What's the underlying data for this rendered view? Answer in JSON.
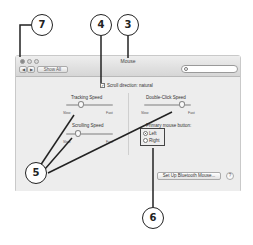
{
  "window": {
    "title": "Mouse",
    "toolbar": {
      "back_label": "◀",
      "forward_label": "▶",
      "show_all_label": "Show All",
      "search_placeholder": ""
    }
  },
  "content": {
    "scroll_direction": {
      "label": "Scroll direction: natural",
      "checked": true,
      "check_glyph": "✓"
    },
    "tracking_speed": {
      "label": "Tracking Speed",
      "min_label": "Slow",
      "max_label": "Fast",
      "value_pct": 33
    },
    "scrolling_speed": {
      "label": "Scrolling Speed",
      "min_label": "Slow",
      "max_label": "Fast",
      "value_pct": 27
    },
    "double_click_speed": {
      "label": "Double-Click Speed",
      "min_label": "Slow",
      "max_label": "Fast",
      "value_pct": 80
    },
    "primary_mouse_button": {
      "label": "Primary mouse button:",
      "options": [
        {
          "label": "Left",
          "selected": true
        },
        {
          "label": "Right",
          "selected": false
        }
      ]
    },
    "bluetooth_button_label": "Set Up Bluetooth Mouse...",
    "help_label": "?"
  },
  "callouts": [
    {
      "number": "7",
      "target": "window-controls"
    },
    {
      "number": "4",
      "target": "scroll-direction"
    },
    {
      "number": "3",
      "target": "window-title"
    },
    {
      "number": "5",
      "target": "speed-sliders"
    },
    {
      "number": "6",
      "target": "primary-mouse-button"
    }
  ],
  "colors": {
    "window_bg": "#ececec",
    "callout_stroke": "#222222"
  }
}
